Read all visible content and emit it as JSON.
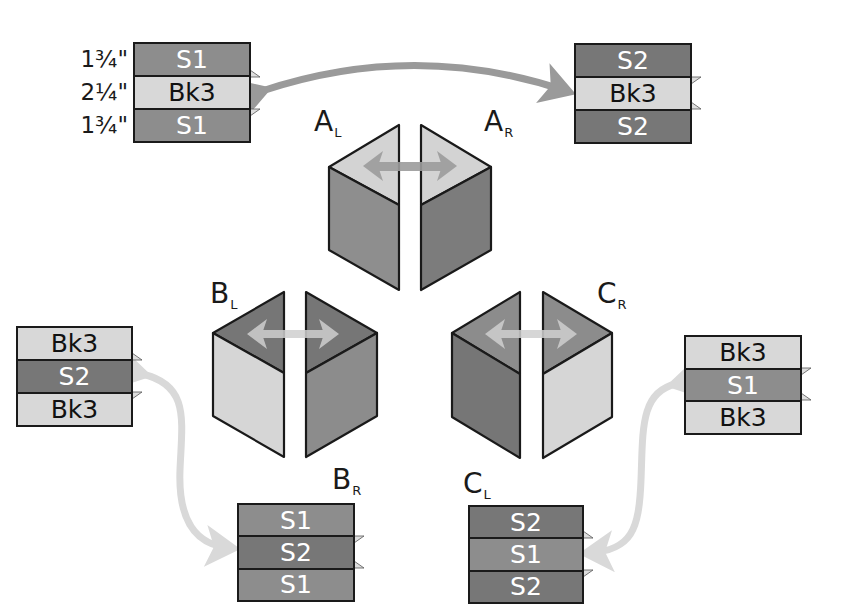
{
  "colors": {
    "S1": "#8d8d8d",
    "S2": "#777777",
    "Bk3": "#d8d8d8",
    "outline": "#1a1a1a",
    "arrow_dark": "#9a9a9a",
    "arrow_light": "#d6d6d6"
  },
  "dimensions": [
    "1¾\"",
    "2¼\"",
    "1¾\""
  ],
  "strip_sets": {
    "A_L": {
      "strips": [
        "S1",
        "Bk3",
        "S1"
      ]
    },
    "A_R": {
      "strips": [
        "S2",
        "Bk3",
        "S2"
      ]
    },
    "B_L": {
      "strips": [
        "Bk3",
        "S2",
        "Bk3"
      ]
    },
    "B_R": {
      "strips": [
        "S1",
        "S2",
        "S1"
      ]
    },
    "C_L": {
      "strips": [
        "S2",
        "S1",
        "S2"
      ]
    },
    "C_R": {
      "strips": [
        "Bk3",
        "S1",
        "Bk3"
      ]
    }
  },
  "cubes": {
    "A": {
      "left_label": "A",
      "left_sub": "L",
      "right_label": "A",
      "right_sub": "R"
    },
    "B": {
      "left_label": "B",
      "left_sub": "L",
      "right_label": "B",
      "right_sub": "R"
    },
    "C": {
      "left_label": "C",
      "left_sub": "L",
      "right_label": "C",
      "right_sub": "R"
    }
  }
}
